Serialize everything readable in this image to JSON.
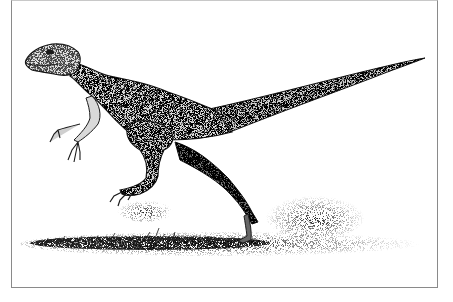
{
  "image": {
    "subject": "small bipedal dinosaur running",
    "style": "pen-and-ink stipple illustration",
    "colors": {
      "background": "#ffffff",
      "frame": "#8a8a8a",
      "ink": "#1a1a1a",
      "mid_tone": "#6e6e6e",
      "light_tone": "#d9d9d9"
    },
    "elements": [
      "frame",
      "dinosaur",
      "ground-patch",
      "dust-spray"
    ]
  }
}
